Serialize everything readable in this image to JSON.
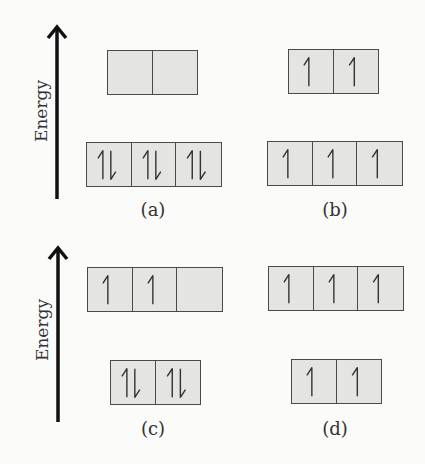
{
  "axis": {
    "label": "Energy",
    "direction": "up"
  },
  "colors": {
    "box_fill": "#e4e4e3",
    "box_border": "#4a4a4a",
    "arrow": "#111111",
    "background": "#fbfbfa"
  },
  "panels": [
    {
      "id": "a",
      "caption": "(a)",
      "upper_level": {
        "orbitals": [
          "empty",
          "empty"
        ]
      },
      "lower_level": {
        "orbitals": [
          "paired",
          "paired",
          "paired"
        ]
      }
    },
    {
      "id": "b",
      "caption": "(b)",
      "upper_level": {
        "orbitals": [
          "up",
          "up"
        ]
      },
      "lower_level": {
        "orbitals": [
          "up",
          "up",
          "up"
        ]
      }
    },
    {
      "id": "c",
      "caption": "(c)",
      "upper_level": {
        "orbitals": [
          "up",
          "up",
          "empty"
        ]
      },
      "lower_level": {
        "orbitals": [
          "paired",
          "paired"
        ]
      }
    },
    {
      "id": "d",
      "caption": "(d)",
      "upper_level": {
        "orbitals": [
          "up",
          "up",
          "up"
        ]
      },
      "lower_level": {
        "orbitals": [
          "up",
          "up"
        ]
      }
    }
  ]
}
